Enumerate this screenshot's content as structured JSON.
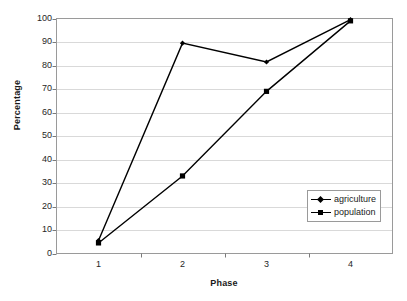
{
  "chart_data": {
    "type": "line",
    "title": "",
    "xlabel": "Phase",
    "ylabel": "Percentage",
    "categories": [
      "1",
      "2",
      "3",
      "4"
    ],
    "x": [
      1,
      2,
      3,
      4
    ],
    "ylim": [
      0,
      100
    ],
    "ytick_step": 10,
    "yticks": [
      "100",
      "90",
      "80",
      "70",
      "60",
      "50",
      "40",
      "30",
      "20",
      "10",
      "0"
    ],
    "ytick_values": [
      100,
      90,
      80,
      70,
      60,
      50,
      40,
      30,
      20,
      10,
      0
    ],
    "grid": "horizontal",
    "grid_color": "#d9d9d9",
    "plot_border_color": "#9a9a9a",
    "background": "#ffffff",
    "line_color": "#000000",
    "legend_position": "bottom-right",
    "series": [
      {
        "name": "agriculture",
        "marker": "diamond",
        "color": "#000000",
        "values": [
          5.5,
          89.5,
          81.5,
          99.5
        ]
      },
      {
        "name": "population",
        "marker": "square",
        "color": "#000000",
        "values": [
          4.5,
          33.0,
          69.0,
          99.0
        ]
      }
    ]
  },
  "legend": {
    "items": [
      {
        "label": "agriculture",
        "marker": "diamond"
      },
      {
        "label": "population",
        "marker": "square"
      }
    ]
  }
}
